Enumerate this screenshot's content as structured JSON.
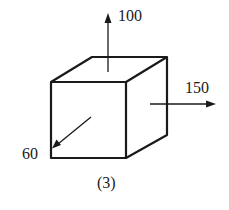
{
  "figure": {
    "caption": "(3)",
    "shape": "cube",
    "arrows": [
      {
        "name": "up",
        "label": "100",
        "direction": "up"
      },
      {
        "name": "right",
        "label": "150",
        "direction": "right"
      },
      {
        "name": "front-diagonal",
        "label": "60",
        "direction": "down-left"
      }
    ],
    "stroke_color": "#1a1a1a"
  }
}
